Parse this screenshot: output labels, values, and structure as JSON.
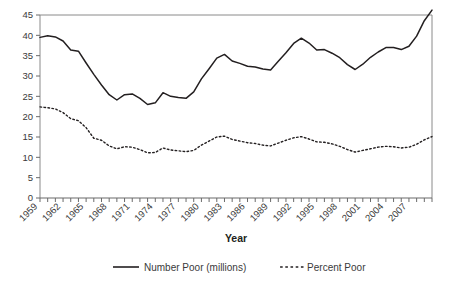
{
  "chart_data": {
    "type": "line",
    "title": "",
    "xlabel": "Year",
    "ylabel": "",
    "grid": false,
    "legend_position": "bottom",
    "xlim": [
      1959,
      2010
    ],
    "ylim": [
      0,
      45
    ],
    "ytick_values": [
      0,
      5,
      10,
      15,
      20,
      25,
      30,
      35,
      40,
      45
    ],
    "ytick_labels": [
      "0",
      "5",
      "10",
      "15",
      "20",
      "25",
      "30",
      "35",
      "40",
      "45"
    ],
    "xtick_labels": [
      "1959",
      "1962",
      "1965",
      "1968",
      "1971",
      "1974",
      "1977",
      "1980",
      "1983",
      "1986",
      "1989",
      "1992",
      "1995",
      "1998",
      "2001",
      "2004",
      "2007"
    ],
    "x": [
      1959,
      1960,
      1961,
      1962,
      1963,
      1964,
      1965,
      1966,
      1967,
      1968,
      1969,
      1970,
      1971,
      1972,
      1973,
      1974,
      1975,
      1976,
      1977,
      1978,
      1979,
      1980,
      1981,
      1982,
      1983,
      1984,
      1985,
      1986,
      1987,
      1988,
      1989,
      1990,
      1991,
      1992,
      1993,
      1994,
      1995,
      1996,
      1997,
      1998,
      1999,
      2000,
      2001,
      2002,
      2003,
      2004,
      2005,
      2006,
      2007,
      2008,
      2009,
      2010
    ],
    "series": [
      {
        "name": "Number Poor (millions)",
        "style": "solid",
        "color": "#231f20",
        "values": [
          39.5,
          39.9,
          39.6,
          38.6,
          36.4,
          36.1,
          33.2,
          30.4,
          27.8,
          25.4,
          24.1,
          25.4,
          25.6,
          24.5,
          23.0,
          23.4,
          25.9,
          25.0,
          24.7,
          24.5,
          26.1,
          29.3,
          31.8,
          34.4,
          35.3,
          33.7,
          33.1,
          32.4,
          32.2,
          31.7,
          31.5,
          33.6,
          35.7,
          38.0,
          39.3,
          38.1,
          36.4,
          36.5,
          35.6,
          34.5,
          32.8,
          31.6,
          32.9,
          34.6,
          35.9,
          37.0,
          37.0,
          36.5,
          37.3,
          39.8,
          43.6,
          46.2
        ]
      },
      {
        "name": "Percent Poor",
        "style": "dashed",
        "color": "#231f20",
        "values": [
          22.4,
          22.2,
          21.9,
          21.0,
          19.5,
          19.0,
          17.3,
          14.7,
          14.2,
          12.8,
          12.1,
          12.6,
          12.5,
          11.9,
          11.1,
          11.2,
          12.3,
          11.8,
          11.6,
          11.4,
          11.7,
          13.0,
          14.0,
          15.0,
          15.2,
          14.4,
          14.0,
          13.6,
          13.4,
          13.0,
          12.8,
          13.5,
          14.2,
          14.8,
          15.1,
          14.5,
          13.8,
          13.7,
          13.3,
          12.7,
          11.9,
          11.3,
          11.7,
          12.1,
          12.5,
          12.7,
          12.6,
          12.3,
          12.5,
          13.2,
          14.3,
          15.1
        ]
      }
    ]
  },
  "legend": {
    "entries": [
      {
        "label": "Number Poor (millions)",
        "style": "solid"
      },
      {
        "label": "Percent Poor",
        "style": "dashed"
      }
    ]
  }
}
